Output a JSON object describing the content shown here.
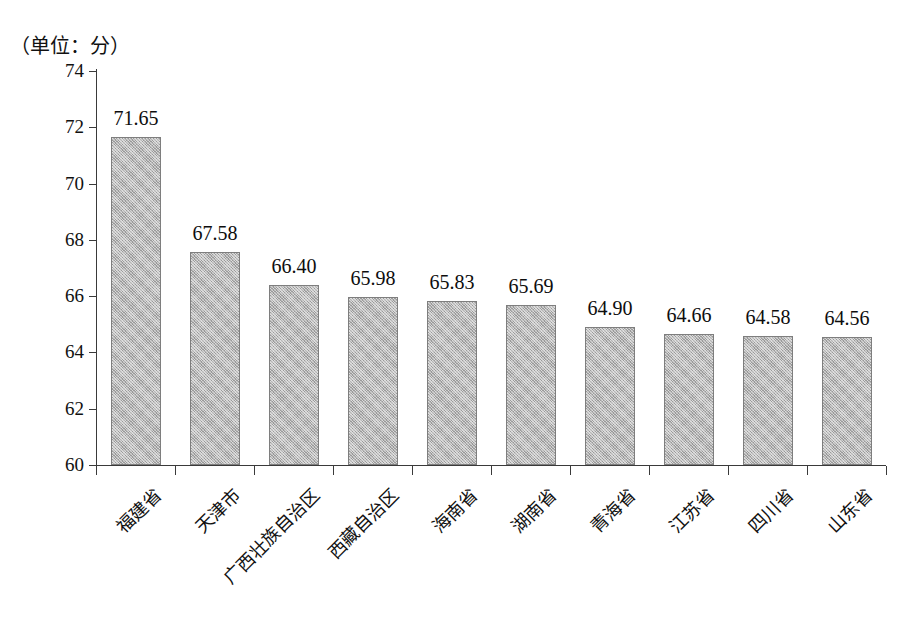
{
  "unit_label": "（单位：分）",
  "chart_data": {
    "type": "bar",
    "title": "",
    "subtitle": "",
    "xlabel": "",
    "ylabel": "",
    "unit_note": "（单位：分）",
    "ylim": [
      60,
      74
    ],
    "ytick_step": 2,
    "yticks": [
      "74",
      "72",
      "70",
      "68",
      "66",
      "64",
      "62",
      "60"
    ],
    "grid": false,
    "legend": false,
    "legend_position": "none",
    "bar_color": "#b6b6b6",
    "bar_edge_color": "#7e7e7e",
    "axis_color": "#3a3a3a",
    "categories": [
      "福建省",
      "天津市",
      "广西壮族自治区",
      "西藏自治区",
      "海南省",
      "湖南省",
      "青海省",
      "江苏省",
      "四川省",
      "山东省"
    ],
    "values": [
      71.65,
      67.58,
      66.4,
      65.98,
      65.83,
      65.69,
      64.9,
      64.66,
      64.58,
      64.56
    ],
    "value_labels": [
      "71.65",
      "67.58",
      "66.40",
      "65.98",
      "65.83",
      "65.69",
      "64.90",
      "64.66",
      "64.58",
      "64.56"
    ]
  }
}
